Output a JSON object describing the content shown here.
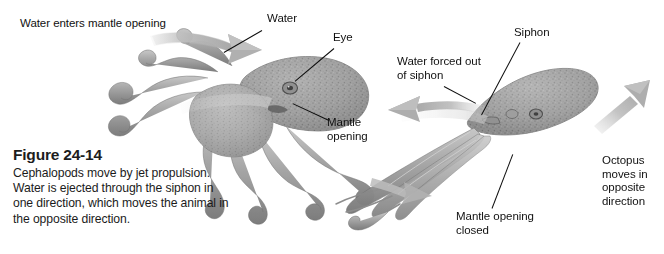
{
  "figure": {
    "number": "Figure 24-14",
    "caption": "Cephalopods move by jet propulsion.\nWater is ejected through the siphon in\none direction, which moves the animal in\nthe opposite direction.",
    "background_color": "#ffffff",
    "text_color": "#111111",
    "illustration_gray": "#9a9a9a",
    "arrow_gray": "#b0b0b0"
  },
  "labels": {
    "water_enters": "Water enters mantle opening",
    "water": "Water",
    "eye": "Eye",
    "mantle_opening": "Mantle\nopening",
    "water_forced_out": "Water forced out\nof siphon",
    "siphon": "Siphon",
    "mantle_opening_closed": "Mantle opening\nclosed",
    "octopus_moves": "Octopus\nmoves in\nopposite\ndirection"
  },
  "arrows": {
    "intake": "curved-arrow-right",
    "siphon_out": "arrow-left",
    "motion": "arrow-up-right",
    "body_thrust": "arrow-down-right"
  },
  "illustration": {
    "left_octopus": "octopus-relaxed-intake",
    "right_octopus": "octopus-streamlined-jetting"
  }
}
